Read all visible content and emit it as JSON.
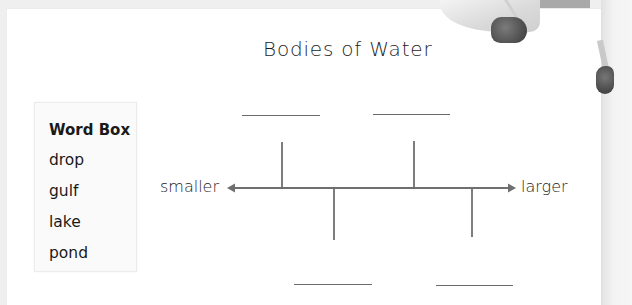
{
  "worksheet": {
    "title": "Bodies of Water",
    "word_box": {
      "heading": "Word Box",
      "words": [
        "drop",
        "gulf",
        "lake",
        "pond"
      ]
    },
    "scale": {
      "left_label": "smaller",
      "right_label": "larger",
      "blanks": [
        {
          "position": "top",
          "order": 1,
          "answer": ""
        },
        {
          "position": "bottom",
          "order": 2,
          "answer": ""
        },
        {
          "position": "top",
          "order": 3,
          "answer": ""
        },
        {
          "position": "bottom",
          "order": 4,
          "answer": ""
        }
      ]
    },
    "colors": {
      "line": "#6a6a6a",
      "text": "#1e1e1e",
      "paper": "#ffffff",
      "background": "#efefef"
    }
  }
}
